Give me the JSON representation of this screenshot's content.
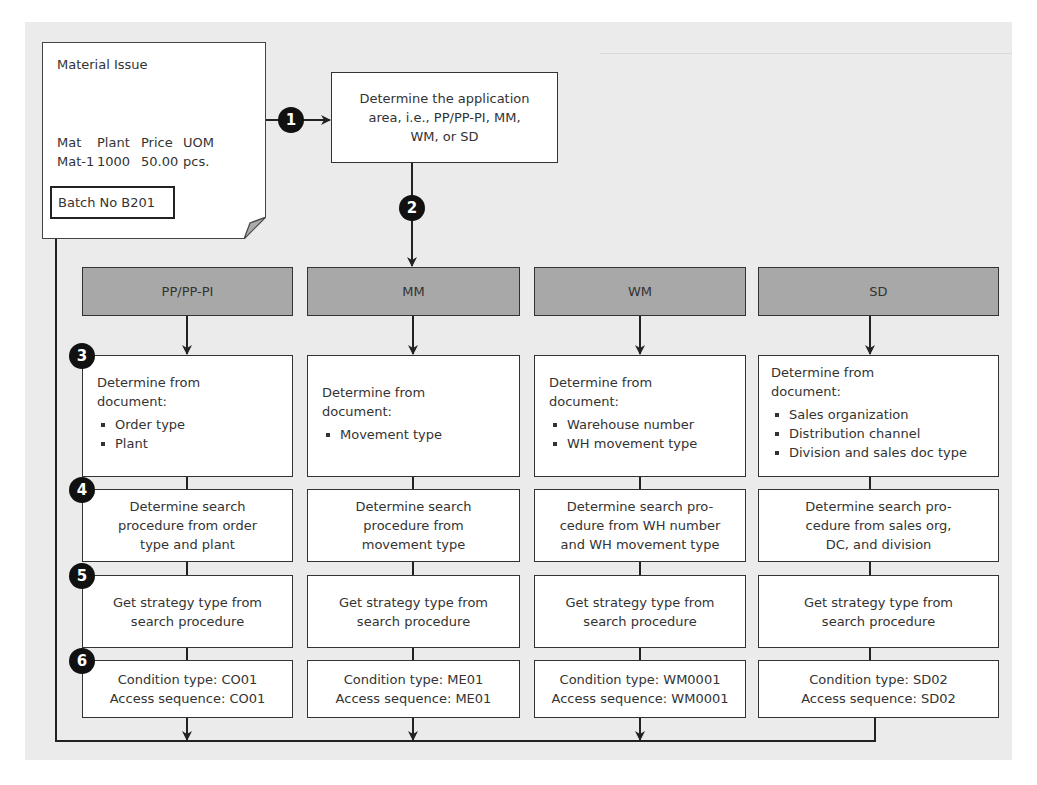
{
  "document": {
    "title": "Material Issue",
    "columns": [
      "Mat",
      "Plant",
      "Price",
      "UOM"
    ],
    "row": [
      "Mat-1",
      "1000",
      "50.00",
      "pcs."
    ],
    "batch": "Batch No B201"
  },
  "steps": {
    "s1": "1",
    "s2": "2",
    "s3": "3",
    "s4": "4",
    "s5": "5",
    "s6": "6"
  },
  "application_area": {
    "line1": "Determine the application",
    "line2": "area, i.e., PP/PP-PI, MM,",
    "line3": "WM, or SD"
  },
  "columns": [
    {
      "header": "PP/PP-PI",
      "determine_title1": "Determine from",
      "determine_title2": "document:",
      "determine_items": [
        "Order type",
        "Plant"
      ],
      "search_procedure": [
        "Determine search",
        "procedure from order",
        "type and plant"
      ],
      "strategy": [
        "Get strategy type from",
        "search procedure"
      ],
      "condition_type": "Condition type: CO01",
      "access_sequence": "Access sequence: CO01"
    },
    {
      "header": "MM",
      "determine_title1": "Determine from",
      "determine_title2": "document:",
      "determine_items": [
        "Movement type"
      ],
      "search_procedure": [
        "Determine search",
        "procedure from",
        "movement type"
      ],
      "strategy": [
        "Get strategy type from",
        "search procedure"
      ],
      "condition_type": "Condition type: ME01",
      "access_sequence": "Access sequence: ME01"
    },
    {
      "header": "WM",
      "determine_title1": "Determine from",
      "determine_title2": "document:",
      "determine_items": [
        "Warehouse number",
        "WH movement type"
      ],
      "search_procedure": [
        "Determine search pro-",
        "cedure from WH number",
        "and WH movement type"
      ],
      "strategy": [
        "Get strategy type from",
        "search procedure"
      ],
      "condition_type": "Condition type: WM0001",
      "access_sequence": "Access sequence: WM0001"
    },
    {
      "header": "SD",
      "determine_title1": "Determine from",
      "determine_title2": "document:",
      "determine_items": [
        "Sales organization",
        "Distribution channel",
        "Division and sales doc type"
      ],
      "search_procedure": [
        "Determine search pro-",
        "cedure from sales org,",
        "DC, and division"
      ],
      "strategy": [
        "Get strategy type from",
        "search procedure"
      ],
      "condition_type": "Condition type: SD02",
      "access_sequence": "Access sequence: SD02"
    }
  ],
  "colors": {
    "panel_bg": "#ebebeb",
    "header_bg": "#a8a8a8",
    "box_bg": "#ffffff",
    "stroke": "#333333",
    "step_marker": "#111111"
  }
}
